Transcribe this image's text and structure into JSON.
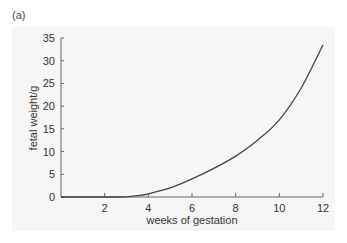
{
  "panel_label": "(a)",
  "chart_data": {
    "type": "line",
    "title": "",
    "xlabel": "weeks of gestation",
    "ylabel": "fetal weight/g",
    "xlim": [
      0,
      12
    ],
    "ylim": [
      0,
      35
    ],
    "x_ticks": [
      2,
      4,
      6,
      8,
      10,
      12
    ],
    "y_ticks": [
      0,
      5,
      10,
      15,
      20,
      25,
      30,
      35
    ],
    "grid": false,
    "legend": null,
    "series": [
      {
        "name": "fetal weight",
        "x": [
          0,
          1,
          2,
          3,
          3.5,
          4,
          5,
          6,
          7,
          8,
          9,
          10,
          11,
          12
        ],
        "values": [
          0,
          0,
          0,
          0.05,
          0.3,
          0.7,
          2.0,
          4.0,
          6.3,
          9.0,
          12.5,
          17.0,
          24.0,
          33.5
        ]
      }
    ],
    "colors": {
      "line": "#444444",
      "axis": "#666666",
      "background": "#f6f6f6"
    }
  }
}
